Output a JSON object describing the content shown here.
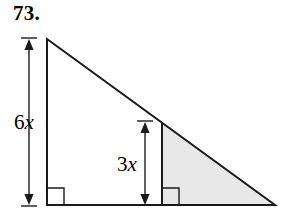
{
  "problem": {
    "number": "73."
  },
  "figure": {
    "labels": [
      {
        "id": "height-large",
        "coefficient": "6",
        "variable": "x",
        "text": "6x"
      },
      {
        "id": "height-small",
        "coefficient": "3",
        "variable": "x",
        "text": "3x"
      }
    ],
    "colors": {
      "stroke": "#1a1a1a",
      "shaded_fill": "#e8e8e8",
      "background": "#ffffff"
    },
    "geometry": {
      "apex": [
        47,
        39
      ],
      "bottom_left": [
        47,
        205
      ],
      "bottom_right": [
        275,
        205
      ],
      "inner_line_top": [
        162,
        122
      ],
      "inner_line_bottom": [
        162,
        205
      ]
    },
    "markers": [
      {
        "id": "right-angle-large",
        "at": [
          47,
          205
        ]
      },
      {
        "id": "right-angle-small",
        "at": [
          162,
          205
        ]
      }
    ],
    "dimension_arrows": [
      {
        "id": "arrow-6x",
        "x": 29,
        "from_y": 39,
        "to_y": 205
      },
      {
        "id": "arrow-3x",
        "x": 145,
        "from_y": 122,
        "to_y": 205
      }
    ]
  }
}
